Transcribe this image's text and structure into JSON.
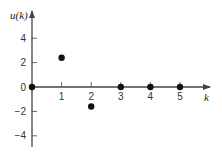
{
  "chart_data": {
    "type": "scatter",
    "title": "",
    "xlabel": "k",
    "ylabel": "u(k)",
    "x": [
      0,
      1,
      2,
      3,
      4,
      5
    ],
    "values": [
      0,
      2.4,
      -1.6,
      0,
      0,
      0
    ],
    "xticks": [
      "1",
      "2",
      "3",
      "4",
      "5"
    ],
    "yticks": [
      "4",
      "2",
      "0",
      "-2",
      "-4"
    ],
    "xlim": [
      0,
      6
    ],
    "ylim": [
      -5,
      6
    ],
    "grid": false,
    "legend": null,
    "marker_color": "#111111",
    "axis_color": "#444444"
  }
}
